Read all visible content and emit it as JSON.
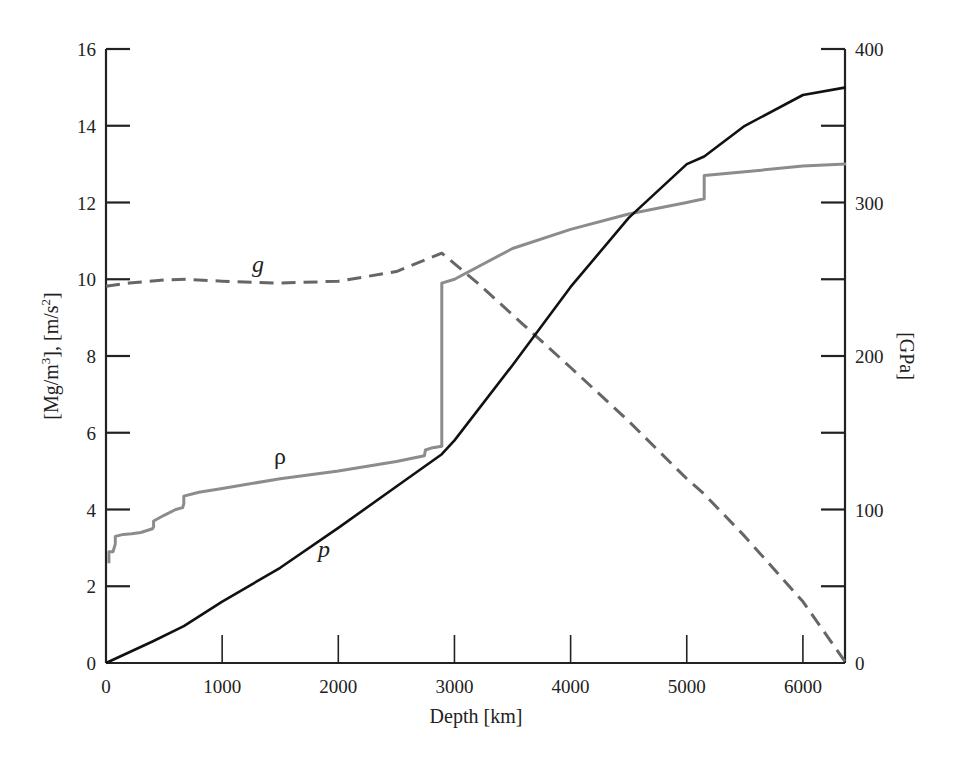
{
  "chart_data": {
    "type": "line",
    "title": "",
    "xlabel": "Depth [km]",
    "ylabel_left": "[Mg/m3], [m/s2]",
    "ylabel_right": "[GPa]",
    "xlim": [
      0,
      6371
    ],
    "ylim_left": [
      0,
      16
    ],
    "ylim_right": [
      0,
      400
    ],
    "x_ticks": [
      0,
      1000,
      2000,
      3000,
      4000,
      5000,
      6000
    ],
    "y_left_ticks": [
      0,
      2,
      4,
      6,
      8,
      10,
      12,
      14,
      16
    ],
    "y_right_ticks": [
      0,
      100,
      200,
      300,
      400
    ],
    "y_right_minor_ticks": [
      50,
      150,
      250,
      350
    ],
    "grid": false,
    "legend": "inline curve labels",
    "series": [
      {
        "name": "ρ",
        "label": "ρ",
        "description": "density [Mg/m3], left axis",
        "style": "solid",
        "color": "#8c8c8c",
        "axis": "left",
        "x": [
          25,
          25,
          60,
          80,
          80,
          150,
          220,
          300,
          400,
          410,
          410,
          500,
          600,
          660,
          670,
          670,
          800,
          1000,
          1500,
          2000,
          2500,
          2741,
          2750,
          2800,
          2891,
          2891,
          2891,
          3000,
          3500,
          4000,
          4500,
          5000,
          5150,
          5150,
          5500,
          6000,
          6371
        ],
        "values": [
          2.6,
          2.9,
          2.9,
          3.1,
          3.3,
          3.35,
          3.37,
          3.4,
          3.5,
          3.55,
          3.7,
          3.85,
          4.0,
          4.05,
          4.15,
          4.35,
          4.45,
          4.55,
          4.8,
          5.0,
          5.25,
          5.4,
          5.55,
          5.6,
          5.65,
          5.7,
          9.9,
          10.0,
          10.8,
          11.3,
          11.7,
          12.0,
          12.1,
          12.7,
          12.8,
          12.95,
          13.0
        ]
      },
      {
        "name": "g",
        "label": "g",
        "description": "gravity [m/s2], left axis",
        "style": "dashed",
        "color": "#666666",
        "axis": "left",
        "x": [
          0,
          200,
          500,
          700,
          1000,
          1500,
          2000,
          2500,
          2891,
          3200,
          3600,
          4000,
          4500,
          5000,
          5150,
          5500,
          6000,
          6371
        ],
        "values": [
          9.82,
          9.9,
          9.98,
          10.0,
          9.95,
          9.9,
          9.95,
          10.2,
          10.68,
          9.9,
          8.8,
          7.7,
          6.3,
          4.8,
          4.4,
          3.3,
          1.6,
          0.0
        ]
      },
      {
        "name": "p",
        "label": "p",
        "description": "pressure [GPa], right axis",
        "style": "solid",
        "color": "#111111",
        "axis": "right",
        "x": [
          0,
          400,
          670,
          1000,
          1500,
          2000,
          2500,
          2891,
          3000,
          3500,
          4000,
          4500,
          5000,
          5150,
          5500,
          6000,
          6371
        ],
        "values": [
          0,
          14,
          24,
          40,
          62,
          88,
          115,
          136,
          145,
          194,
          245,
          290,
          325,
          330,
          350,
          370,
          375
        ]
      }
    ],
    "annotations": [
      {
        "text": "g",
        "x": 1350,
        "y": 10.3,
        "axis": "left"
      },
      {
        "text": "ρ",
        "x": 1550,
        "y": 5.15,
        "axis": "left"
      },
      {
        "text": "p",
        "x": 1850,
        "y": 2.6,
        "axis": "left"
      }
    ]
  },
  "axes": {
    "x_title": "Depth [km]",
    "y_left_title_main": "[Mg/m",
    "y_left_title_sup1": "3",
    "y_left_title_mid": "], [m/s",
    "y_left_title_sup2": "2",
    "y_left_title_end": "]",
    "y_right_title": "[GPa]",
    "x_tick_labels": [
      "0",
      "1000",
      "2000",
      "3000",
      "4000",
      "5000",
      "6000"
    ],
    "y_left_tick_labels": [
      "0",
      "2",
      "4",
      "6",
      "8",
      "10",
      "12",
      "14",
      "16"
    ],
    "y_right_tick_labels": [
      "0",
      "100",
      "200",
      "300",
      "400"
    ]
  },
  "labels": {
    "g": "g",
    "rho": "ρ",
    "p": "p"
  }
}
